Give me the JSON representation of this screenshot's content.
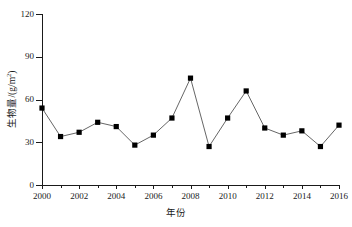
{
  "chart_data": {
    "type": "line",
    "title": "",
    "xlabel": "年份",
    "ylabel": "生物量/(g/m2)",
    "ylabel_base": "生物量/(g/m",
    "ylabel_sup": "2",
    "ylabel_tail": ")",
    "xlim": [
      2000,
      2016
    ],
    "ylim": [
      0,
      120
    ],
    "grid": false,
    "legend": null,
    "marker": "filled-square",
    "line_color": "#555555",
    "marker_color": "#000000",
    "axis_color": "#1a1a1a",
    "y_ticks": [
      0,
      30,
      60,
      90,
      120
    ],
    "y_tick_labels": [
      "0",
      "30",
      "60",
      "90",
      "120"
    ],
    "x_ticks": [
      2000,
      2001,
      2002,
      2003,
      2004,
      2005,
      2006,
      2007,
      2008,
      2009,
      2010,
      2011,
      2012,
      2013,
      2014,
      2015,
      2016
    ],
    "x_tick_labels_major": [
      "2000",
      "2002",
      "2004",
      "2006",
      "2008",
      "2010",
      "2012",
      "2014",
      "2016"
    ],
    "x_major_ticks": [
      2000,
      2002,
      2004,
      2006,
      2008,
      2010,
      2012,
      2014,
      2016
    ],
    "x": [
      2000,
      2001,
      2002,
      2003,
      2004,
      2005,
      2006,
      2007,
      2008,
      2009,
      2010,
      2011,
      2012,
      2013,
      2014,
      2015,
      2016
    ],
    "values": [
      54,
      34,
      37,
      44,
      41,
      28,
      35,
      47,
      75,
      27,
      47,
      66,
      40,
      35,
      38,
      27,
      42
    ],
    "series": [
      {
        "name": "生物量",
        "values": [
          54,
          34,
          37,
          44,
          41,
          28,
          35,
          47,
          75,
          27,
          47,
          66,
          40,
          35,
          38,
          27,
          42
        ]
      }
    ]
  }
}
